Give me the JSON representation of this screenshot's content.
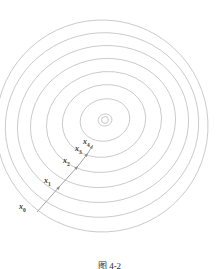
{
  "figure": {
    "type": "contour-descent-diagram",
    "caption": "图 4-2",
    "colors": {
      "contour": "#b9b9b9",
      "path": "#8c8c8c",
      "label": "#3a3a3a",
      "background": "#ffffff"
    }
  },
  "chart_data": {
    "type": "line",
    "title": "",
    "subtitle": "",
    "xlabel": "",
    "ylabel": "",
    "xlim": [
      0,
      219
    ],
    "ylim": [
      0,
      267
    ],
    "grid": false,
    "legend": null,
    "center": {
      "x": 105,
      "y": 120,
      "label": "optimum"
    },
    "contour_count": 8,
    "contours": [
      {
        "index": 1,
        "cx": 105,
        "cy": 120,
        "rx": 7,
        "ry": 6,
        "rot": -14
      },
      {
        "index": 2,
        "cx": 105,
        "cy": 120,
        "rx": 25,
        "ry": 21,
        "rot": -14
      },
      {
        "index": 3,
        "cx": 104,
        "cy": 121,
        "rx": 42,
        "ry": 36,
        "rot": -14
      },
      {
        "index": 4,
        "cx": 104,
        "cy": 122,
        "rx": 58,
        "ry": 50,
        "rot": -14
      },
      {
        "index": 5,
        "cx": 103,
        "cy": 123,
        "rx": 73,
        "ry": 64,
        "rot": -14
      },
      {
        "index": 6,
        "cx": 103,
        "cy": 124,
        "rx": 86,
        "ry": 78,
        "rot": -14
      },
      {
        "index": 7,
        "cx": 102,
        "cy": 125,
        "rx": 97,
        "ry": 92,
        "rot": -14
      },
      {
        "index": 8,
        "cx": 102,
        "cy": 126,
        "rx": 106,
        "ry": 106,
        "rot": -14
      }
    ],
    "iterates": [
      {
        "name": "x0",
        "label": "x",
        "sub": "0",
        "x": 37,
        "y": 212,
        "label_x": 19,
        "label_y": 203
      },
      {
        "name": "x1",
        "label": "x",
        "sub": "1",
        "x": 60,
        "y": 186,
        "label_x": 44,
        "label_y": 177
      },
      {
        "name": "x2",
        "label": "x",
        "sub": "2",
        "x": 78,
        "y": 166,
        "label_x": 63,
        "label_y": 157
      },
      {
        "name": "x3",
        "label": "x",
        "sub": "3",
        "x": 88,
        "y": 153,
        "label_x": 75,
        "label_y": 145
      },
      {
        "name": "x4",
        "label": "x",
        "sub": "4",
        "x": 93,
        "y": 145,
        "label_x": 83,
        "label_y": 138
      }
    ],
    "segments": [
      {
        "from": "x0",
        "to": "x1"
      },
      {
        "from": "x1",
        "to": "x2"
      },
      {
        "from": "x2",
        "to": "x3"
      },
      {
        "from": "x3",
        "to": "x4"
      }
    ]
  }
}
